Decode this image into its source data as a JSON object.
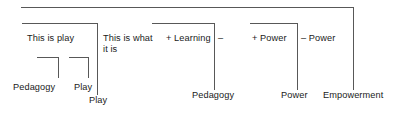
{
  "diagram": {
    "type": "tree-bracket-diagram",
    "title": "",
    "width": 397,
    "height": 115,
    "line_color": "#585858",
    "text_color": "#1a1a1a",
    "background": "#ffffff",
    "levels": [
      {
        "name": "middle-row",
        "nodes": [
          {
            "id": "this-is-play",
            "text": "This is play"
          },
          {
            "id": "this-is-what-it-is",
            "text": "This is what\nit is"
          },
          {
            "id": "plus-learning",
            "text": "+ Learning"
          },
          {
            "id": "minus-learning",
            "text": "–"
          },
          {
            "id": "plus-power",
            "text": "+ Power"
          },
          {
            "id": "minus-power",
            "text": "– Power"
          }
        ]
      },
      {
        "name": "bottom-row",
        "nodes": [
          {
            "id": "pedagogy-left",
            "text": "Pedagogy"
          },
          {
            "id": "play-left",
            "text": "Play"
          },
          {
            "id": "play-lower",
            "text": "Play"
          },
          {
            "id": "pedagogy-mid",
            "text": "Pedagogy"
          },
          {
            "id": "power",
            "text": "Power"
          },
          {
            "id": "empowerment",
            "text": "Empowerment"
          }
        ]
      }
    ]
  },
  "labels": {
    "this_is_play": "This is play",
    "this_is_what_it_is": "This is what\nit is",
    "plus_learning": "+ Learning",
    "minus_learning": "–",
    "plus_power": "+ Power",
    "minus_power": "– Power",
    "pedagogy_left": "Pedagogy",
    "play_left": "Play",
    "play_lower": "Play",
    "pedagogy_mid": "Pedagogy",
    "power": "Power",
    "empowerment": "Empowerment"
  }
}
